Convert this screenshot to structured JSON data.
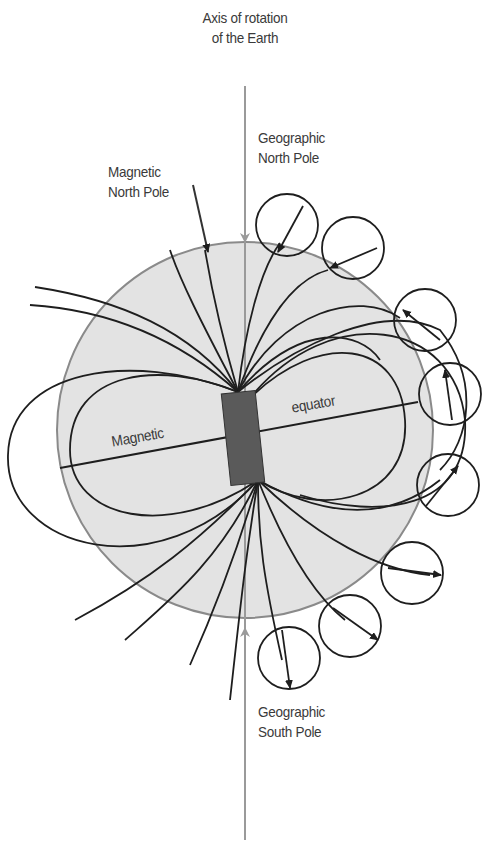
{
  "diagram": {
    "labels": {
      "axis_line1": "Axis of rotation",
      "axis_line2": "of the Earth",
      "geo_north_line1": "Geographic",
      "geo_north_line2": "North Pole",
      "mag_north_line1": "Magnetic",
      "mag_north_line2": "North Pole",
      "mag_equator_left": "Magnetic",
      "mag_equator_right": "equator",
      "geo_south_line1": "Geographic",
      "geo_south_line2": "South Pole"
    },
    "colors": {
      "earth_fill": "#e3e3e3",
      "earth_outline": "#8a8a8a",
      "axis_line": "#9a9a9a",
      "field_lines": "#1e1e1e",
      "bar_magnet": "#5a5a5a",
      "text": "#3a3a3a"
    },
    "elements": {
      "earth": "circle",
      "bar_magnet": "tilted rectangle at center",
      "compasses_count": 9
    }
  }
}
